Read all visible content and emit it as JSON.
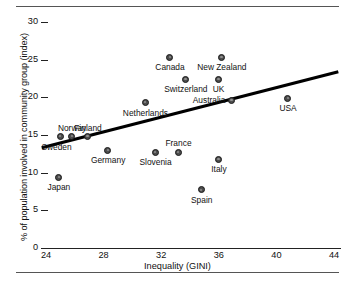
{
  "figure": {
    "clipped_title": "",
    "rules": {
      "top": true,
      "bottom": true
    }
  },
  "chart_data": {
    "type": "scatter",
    "title": "",
    "xlabel": "Inequality (GINI)",
    "ylabel": "% of population involved in community group (index)",
    "xlim": [
      24,
      44
    ],
    "ylim": [
      0,
      30
    ],
    "xticks": [
      24,
      28,
      32,
      36,
      40,
      44
    ],
    "yticks": [
      0,
      5,
      10,
      15,
      20,
      25,
      30
    ],
    "grid": false,
    "legend": "none",
    "marker_color": "#4d4d4d",
    "trendline": {
      "type": "linear",
      "x": [
        23.7,
        44.3
      ],
      "y": [
        13.3,
        23.4
      ],
      "color": "#000000"
    },
    "points": [
      {
        "label": "Sweden",
        "x": 25.0,
        "y": 14.8,
        "label_pos": "below-left"
      },
      {
        "label": "Norway",
        "x": 25.8,
        "y": 14.8,
        "label_pos": "above"
      },
      {
        "label": "Finland",
        "x": 26.9,
        "y": 14.8,
        "label_pos": "above"
      },
      {
        "label": "Japan",
        "x": 24.9,
        "y": 9.4,
        "label_pos": "below"
      },
      {
        "label": "Germany",
        "x": 28.3,
        "y": 13.0,
        "label_pos": "below"
      },
      {
        "label": "Netherlands",
        "x": 30.9,
        "y": 19.3,
        "label_pos": "below"
      },
      {
        "label": "Switzerland",
        "x": 33.7,
        "y": 22.4,
        "label_pos": "below"
      },
      {
        "label": "Canada",
        "x": 32.6,
        "y": 25.3,
        "label_pos": "below"
      },
      {
        "label": "Slovenia",
        "x": 31.6,
        "y": 12.7,
        "label_pos": "below"
      },
      {
        "label": "France",
        "x": 33.2,
        "y": 12.7,
        "label_pos": "above"
      },
      {
        "label": "Australia",
        "x": 36.9,
        "y": 19.6,
        "label_pos": "left"
      },
      {
        "label": "UK",
        "x": 36.0,
        "y": 22.4,
        "label_pos": "below"
      },
      {
        "label": "New Zealand",
        "x": 36.2,
        "y": 25.3,
        "label_pos": "below"
      },
      {
        "label": "Italy",
        "x": 36.0,
        "y": 11.8,
        "label_pos": "below"
      },
      {
        "label": "Spain",
        "x": 34.8,
        "y": 7.7,
        "label_pos": "below"
      },
      {
        "label": "USA",
        "x": 40.8,
        "y": 19.9,
        "label_pos": "below"
      }
    ]
  }
}
